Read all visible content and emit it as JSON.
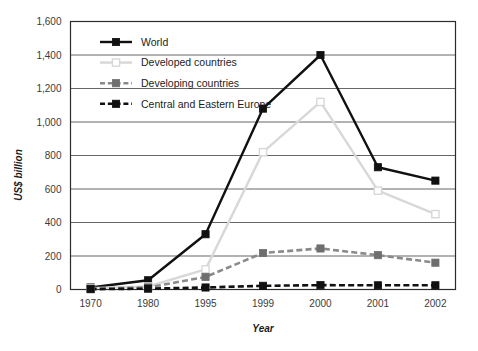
{
  "chart_data": {
    "type": "line",
    "title": "",
    "xlabel": "Year",
    "ylabel": "US$ billion",
    "categories": [
      "1970",
      "1980",
      "1995",
      "1999",
      "2000",
      "2001",
      "2002"
    ],
    "ylim": [
      0,
      1600
    ],
    "ytick_step": 200,
    "ytick_labels": [
      "0",
      "200",
      "400",
      "600",
      "800",
      "1,000",
      "1,200",
      "1,400",
      "1,600"
    ],
    "ytick_values": [
      0,
      200,
      400,
      600,
      800,
      1000,
      1200,
      1400,
      1600
    ],
    "grid": "horizontal",
    "legend_position": "top-left-inside",
    "series": [
      {
        "name": "World",
        "values": [
          12,
          55,
          330,
          1080,
          1400,
          730,
          650
        ],
        "color": "#111111",
        "line_style": "solid",
        "marker": "filled-square",
        "marker_fill": "#111111"
      },
      {
        "name": "Developed countries",
        "values": [
          8,
          18,
          120,
          820,
          1120,
          590,
          450
        ],
        "color": "#d8d8d8",
        "line_style": "solid",
        "marker": "open-square",
        "marker_fill": "#ffffff"
      },
      {
        "name": "Developing countries",
        "values": [
          5,
          12,
          75,
          218,
          245,
          205,
          160
        ],
        "color": "#8a8a8a",
        "line_style": "dashed",
        "marker": "filled-square",
        "marker_fill": "#6e6e6e"
      },
      {
        "name": "Central and Eastern Europe",
        "values": [
          2,
          5,
          12,
          22,
          26,
          25,
          25
        ],
        "color": "#111111",
        "line_style": "dashed",
        "marker": "filled-square",
        "marker_fill": "#111111"
      }
    ]
  }
}
